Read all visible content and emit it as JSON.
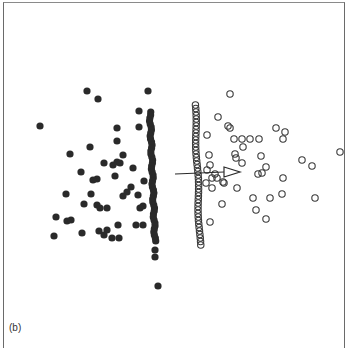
{
  "panel_label": "(b)",
  "colors": {
    "filled": "#2a2a2a",
    "open_stroke": "#3a3a3a",
    "arrow": "#2a2a2a",
    "frame": "#6a6a6a"
  },
  "chart_data": {
    "type": "scatter",
    "title": "",
    "xlabel": "",
    "ylabel": "",
    "grid": false,
    "legend": null,
    "annotations": [
      "(b)",
      "arrow pointing right from filled-group column toward open-circle group"
    ],
    "pixel_space": {
      "width": 347,
      "height": 344
    },
    "series": [
      {
        "name": "filled",
        "marker": "filled-circle",
        "points": [
          [
            87,
            91
          ],
          [
            98,
            99
          ],
          [
            40,
            126
          ],
          [
            148,
            91
          ],
          [
            139,
            111
          ],
          [
            117,
            128
          ],
          [
            139,
            127
          ],
          [
            117,
            141
          ],
          [
            90,
            147
          ],
          [
            70,
            154
          ],
          [
            123,
            155
          ],
          [
            117,
            162
          ],
          [
            104,
            163
          ],
          [
            113,
            165
          ],
          [
            120,
            163
          ],
          [
            81,
            172
          ],
          [
            97,
            179
          ],
          [
            93,
            180
          ],
          [
            133,
            168
          ],
          [
            115,
            176
          ],
          [
            144,
            181
          ],
          [
            66,
            194
          ],
          [
            91,
            194
          ],
          [
            131,
            187
          ],
          [
            127,
            192
          ],
          [
            123,
            196
          ],
          [
            138,
            195
          ],
          [
            84,
            204
          ],
          [
            97,
            205
          ],
          [
            107,
            208
          ],
          [
            100,
            208
          ],
          [
            143,
            206
          ],
          [
            140,
            208
          ],
          [
            56,
            217
          ],
          [
            67,
            221
          ],
          [
            71,
            220
          ],
          [
            118,
            225
          ],
          [
            136,
            225
          ],
          [
            143,
            225
          ],
          [
            54,
            236
          ],
          [
            82,
            233
          ],
          [
            99,
            231
          ],
          [
            107,
            230
          ],
          [
            104,
            235
          ],
          [
            112,
            238
          ],
          [
            119,
            238
          ],
          [
            155,
            250
          ],
          [
            155,
            257
          ],
          [
            158,
            286
          ]
        ],
        "column": {
          "x_top": 150,
          "x_bottom": 155,
          "y_start": 112,
          "y_end": 242,
          "step": 3
        }
      },
      {
        "name": "open",
        "marker": "open-circle",
        "points": [
          [
            230,
            94
          ],
          [
            218,
            117
          ],
          [
            228,
            126
          ],
          [
            230,
            128
          ],
          [
            207,
            135
          ],
          [
            276,
            128
          ],
          [
            285,
            132
          ],
          [
            283,
            139
          ],
          [
            234,
            139
          ],
          [
            242,
            139
          ],
          [
            250,
            139
          ],
          [
            259,
            139
          ],
          [
            243,
            147
          ],
          [
            209,
            155
          ],
          [
            235,
            154
          ],
          [
            236,
            158
          ],
          [
            261,
            156
          ],
          [
            242,
            163
          ],
          [
            210,
            165
          ],
          [
            302,
            160
          ],
          [
            312,
            166
          ],
          [
            340,
            152
          ],
          [
            266,
            167
          ],
          [
            258,
            174
          ],
          [
            262,
            173
          ],
          [
            207,
            170
          ],
          [
            215,
            174
          ],
          [
            212,
            178
          ],
          [
            217,
            178
          ],
          [
            223,
            182
          ],
          [
            206,
            183
          ],
          [
            212,
            188
          ],
          [
            237,
            188
          ],
          [
            283,
            178
          ],
          [
            224,
            183
          ],
          [
            253,
            198
          ],
          [
            270,
            198
          ],
          [
            315,
            198
          ],
          [
            282,
            194
          ],
          [
            222,
            204
          ],
          [
            256,
            210
          ],
          [
            266,
            219
          ],
          [
            210,
            222
          ]
        ],
        "column": {
          "x_top": 195,
          "x_bottom": 200,
          "y_start": 105,
          "y_end": 245,
          "step": 3.5
        }
      }
    ],
    "arrow": {
      "x1": 175,
      "y1": 174,
      "x2": 230,
      "y2": 172,
      "head": "open-triangle"
    }
  }
}
